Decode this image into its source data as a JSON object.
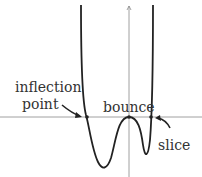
{
  "diagram": {
    "type": "polynomial-graph",
    "labels": {
      "inflection_line1": "inflection",
      "inflection_line2": "point",
      "bounce": "bounce",
      "slice": "slice"
    },
    "colors": {
      "curve": "#222222",
      "axis": "#888888",
      "text": "#333333"
    }
  }
}
